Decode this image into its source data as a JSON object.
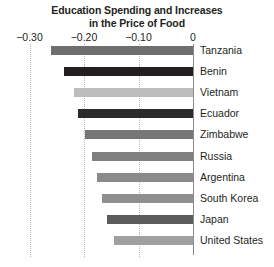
{
  "chart_data": {
    "type": "bar",
    "orientation": "horizontal",
    "title": "Education Spending and Increases in the Price of Food",
    "title_lines": [
      "Education Spending and Increases",
      "in the Price of Food"
    ],
    "xlabel": "",
    "ylabel": "",
    "xlim": [
      -0.3,
      0
    ],
    "xticks": [
      -0.3,
      -0.2,
      -0.1,
      0
    ],
    "xtick_labels": [
      "−0.30",
      "−0.20",
      "−0.10",
      "0"
    ],
    "grid": true,
    "grid_axis": "x",
    "grid_style": "dotted",
    "legend": "none",
    "label_position": "right-of-axis",
    "categories": [
      "Tanzania",
      "Benin",
      "Vietnam",
      "Ecuador",
      "Zimbabwe",
      "Russia",
      "Argentina",
      "South Korea",
      "Japan",
      "United States"
    ],
    "values": [
      -0.26,
      -0.237,
      -0.219,
      -0.211,
      -0.198,
      -0.185,
      -0.176,
      -0.167,
      -0.158,
      -0.145
    ],
    "bar_colors": [
      "#6e6e6e",
      "#231f20",
      "#bcbcbc",
      "#2b2b2b",
      "#767676",
      "#808080",
      "#8a8a8a",
      "#8f8f8f",
      "#5c5c5c",
      "#a0a0a0"
    ],
    "bars": [
      {
        "label": "Tanzania",
        "value": -0.26,
        "color": "#6e6e6e"
      },
      {
        "label": "Benin",
        "value": -0.237,
        "color": "#231f20"
      },
      {
        "label": "Vietnam",
        "value": -0.219,
        "color": "#bcbcbc"
      },
      {
        "label": "Ecuador",
        "value": -0.211,
        "color": "#2b2b2b"
      },
      {
        "label": "Zimbabwe",
        "value": -0.198,
        "color": "#767676"
      },
      {
        "label": "Russia",
        "value": -0.185,
        "color": "#808080"
      },
      {
        "label": "Argentina",
        "value": -0.176,
        "color": "#8a8a8a"
      },
      {
        "label": "South Korea",
        "value": -0.167,
        "color": "#8f8f8f"
      },
      {
        "label": "Japan",
        "value": -0.158,
        "color": "#5c5c5c"
      },
      {
        "label": "United States",
        "value": -0.145,
        "color": "#a0a0a0"
      }
    ]
  },
  "colors": {
    "background": "#ffffff",
    "text": "#231f20",
    "gridline": "#b9b2a9",
    "axis_line": "#8c8c8c"
  }
}
